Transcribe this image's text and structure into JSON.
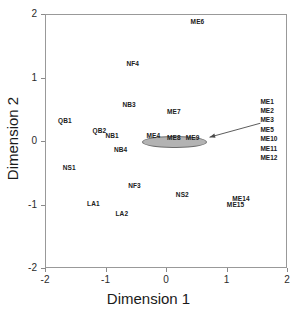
{
  "chart_data": {
    "type": "scatter",
    "title": "",
    "xlabel": "Dimension 1",
    "ylabel": "Dimension 2",
    "xlim": [
      -2,
      2
    ],
    "ylim": [
      -2,
      2
    ],
    "xticks": [
      "-2",
      "-1",
      "0",
      "1",
      "2"
    ],
    "xtick_values": [
      -2,
      -1,
      0,
      1,
      2
    ],
    "yticks": [
      "-2",
      "-1",
      "0",
      "1",
      "2"
    ],
    "ytick_values": [
      -2,
      -1,
      0,
      1,
      2
    ],
    "grid": false,
    "legend_position": "none",
    "point_style": "text-labels-only",
    "points": [
      {
        "label": "ME6",
        "x": 0.52,
        "y": 1.89
      },
      {
        "label": "NF4",
        "x": -0.55,
        "y": 1.23
      },
      {
        "label": "NB3",
        "x": -0.61,
        "y": 0.58
      },
      {
        "label": "ME7",
        "x": 0.13,
        "y": 0.47
      },
      {
        "label": "QB1",
        "x": -1.67,
        "y": 0.33
      },
      {
        "label": "QB2",
        "x": -1.1,
        "y": 0.18
      },
      {
        "label": "NB1",
        "x": -0.89,
        "y": 0.1
      },
      {
        "label": "ME4",
        "x": -0.21,
        "y": 0.09
      },
      {
        "label": "ME8",
        "x": 0.13,
        "y": 0.07
      },
      {
        "label": "ME9",
        "x": 0.44,
        "y": 0.07
      },
      {
        "label": "NB4",
        "x": -0.75,
        "y": -0.12
      },
      {
        "label": "NS1",
        "x": -1.6,
        "y": -0.41
      },
      {
        "label": "NF3",
        "x": -0.52,
        "y": -0.7
      },
      {
        "label": "NS2",
        "x": 0.27,
        "y": -0.83
      },
      {
        "label": "ME14",
        "x": 1.24,
        "y": -0.89
      },
      {
        "label": "ME15",
        "x": 1.15,
        "y": -0.99
      },
      {
        "label": "LA1",
        "x": -1.2,
        "y": -0.97
      },
      {
        "label": "LA2",
        "x": -0.73,
        "y": -1.14
      }
    ],
    "cluster_ellipse": {
      "label": "grouped-me-cluster",
      "center_x": 0.13,
      "center_y": 0.0,
      "width_data": 1.04,
      "height_data": 0.17,
      "fill_color": "#b3b3b3",
      "border_color": "#6e6e6e"
    },
    "callout": {
      "members": [
        "ME1",
        "ME2",
        "ME3",
        "ME5",
        "ME10",
        "ME11",
        "ME12"
      ],
      "arrow_from_x": 1.56,
      "arrow_from_y": 0.28,
      "arrow_to_x": 0.72,
      "arrow_to_y": 0.06
    },
    "colors": {
      "background": "#ffffff",
      "frame": "#999999",
      "text": "#202020",
      "axis_title": "#1a1a1a",
      "ellipse_fill": "#b3b3b3"
    }
  }
}
